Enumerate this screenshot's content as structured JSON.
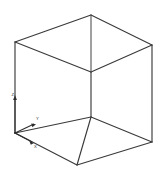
{
  "viewport": {
    "name": "wireframe-cube-viewport",
    "width": 163,
    "height": 172,
    "background_color": "#ffffff",
    "line_color": "#3a3a3a",
    "projection": "isometric",
    "render_mode": "wireframe"
  },
  "model": {
    "shape_label": "cube",
    "vertices": {
      "top": {
        "id": "V-top",
        "x": 91,
        "y": 15
      },
      "top_left": {
        "id": "V-top-left",
        "x": 15,
        "y": 42
      },
      "top_right": {
        "id": "V-top-right",
        "x": 152,
        "y": 45
      },
      "inner_top": {
        "id": "V-inner-top",
        "x": 91,
        "y": 72
      },
      "bottom_left": {
        "id": "V-bottom-left",
        "x": 15,
        "y": 133
      },
      "bottom_right": {
        "id": "V-bottom-right",
        "x": 152,
        "y": 142
      },
      "inner_bottom": {
        "id": "V-inner-bottom",
        "x": 91,
        "y": 117
      },
      "bottom": {
        "id": "V-bottom",
        "x": 77,
        "y": 165
      }
    },
    "edges": [
      {
        "id": "E-top-back-left",
        "from": "top_left",
        "to": "top"
      },
      {
        "id": "E-top-back-right",
        "from": "top",
        "to": "top_right"
      },
      {
        "id": "E-top-front-left",
        "from": "top_left",
        "to": "inner_top"
      },
      {
        "id": "E-top-front-right",
        "from": "inner_top",
        "to": "top_right"
      },
      {
        "id": "E-vertical-left",
        "from": "top_left",
        "to": "bottom_left"
      },
      {
        "id": "E-vertical-right",
        "from": "top_right",
        "to": "bottom_right"
      },
      {
        "id": "E-vertical-back",
        "from": "top",
        "to": "inner_top"
      },
      {
        "id": "E-vertical-inner",
        "from": "inner_top",
        "to": "inner_bottom"
      },
      {
        "id": "E-mid-left",
        "from": "bottom_left",
        "to": "inner_bottom"
      },
      {
        "id": "E-mid-right",
        "from": "inner_bottom",
        "to": "bottom_right"
      },
      {
        "id": "E-bottom-left",
        "from": "bottom_left",
        "to": "bottom"
      },
      {
        "id": "E-bottom-right",
        "from": "bottom",
        "to": "bottom_right"
      },
      {
        "id": "E-vertical-front",
        "from": "inner_bottom",
        "to": "bottom"
      }
    ]
  },
  "axis_indicator": {
    "name": "coordinate-axis-triad",
    "origin": {
      "x": 15,
      "y": 133
    },
    "axes": [
      {
        "id": "axis-z",
        "label": "Z",
        "tip_x": 15,
        "tip_y": 96,
        "label_x": 11.5,
        "label_y": 96
      },
      {
        "id": "axis-y",
        "label": "Y",
        "tip_x": 36,
        "tip_y": 123,
        "label_x": 36,
        "label_y": 120
      },
      {
        "id": "axis-x",
        "label": "X",
        "tip_x": 34,
        "tip_y": 143,
        "label_x": 34,
        "label_y": 148
      }
    ]
  }
}
